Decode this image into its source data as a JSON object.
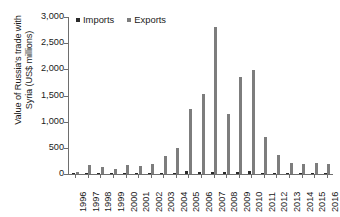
{
  "chart_data": {
    "type": "bar",
    "title": "",
    "xlabel": "",
    "ylabel": "Value of Russia's trade with Syria (US$ millions)",
    "ylabel_lines": [
      "Value of Russia's trade with",
      "Syria (US$ millions)"
    ],
    "categories": [
      "1996",
      "1997",
      "1998",
      "1999",
      "2000",
      "2001",
      "2002",
      "2003",
      "2004",
      "2005",
      "2006",
      "2007",
      "2008",
      "2009",
      "2010",
      "2011",
      "2012",
      "2013",
      "2014",
      "2015",
      "2016"
    ],
    "series": [
      {
        "name": "Imports",
        "color": "#2b2b2b",
        "values": [
          8,
          10,
          8,
          8,
          25,
          12,
          10,
          15,
          22,
          55,
          45,
          35,
          30,
          45,
          50,
          20,
          12,
          10,
          8,
          10,
          10
        ]
      },
      {
        "name": "Exports",
        "color": "#7d7d7d",
        "values": [
          35,
          165,
          140,
          95,
          175,
          155,
          185,
          350,
          490,
          1250,
          1530,
          2800,
          1155,
          1850,
          1995,
          700,
          370,
          220,
          190,
          215,
          200
        ]
      }
    ],
    "ylim": [
      0,
      3000
    ],
    "ytick_values": [
      0,
      500,
      1000,
      1500,
      2000,
      2500,
      3000
    ],
    "ytick_labels": [
      "0",
      "500",
      "1,000",
      "1,500",
      "2,000",
      "2,500",
      "3,000"
    ],
    "grid": false,
    "legend_position": "top-left-inside",
    "legend": [
      {
        "label": "Imports",
        "color": "#2b2b2b",
        "swatch_icon": "square-marker-icon"
      },
      {
        "label": "Exports",
        "color": "#7d7d7d",
        "swatch_icon": "square-marker-icon"
      }
    ],
    "axis_color": "#6e6e6e"
  }
}
